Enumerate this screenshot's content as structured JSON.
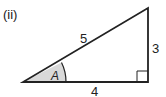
{
  "diagram": {
    "part_label": "(ii)",
    "angle_label": "A",
    "sides": {
      "hypotenuse": "5",
      "opposite": "3",
      "adjacent": "4"
    },
    "colors": {
      "stroke": "#222222",
      "angle_fill": "#d9d9d9"
    }
  }
}
